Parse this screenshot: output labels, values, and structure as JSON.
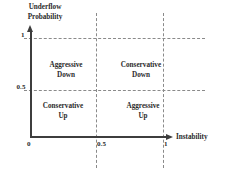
{
  "chart_data": {
    "type": "scatter",
    "title": "",
    "xlabel": "Instability",
    "ylabel": "Underflow Probability",
    "ylabel_line1": "Underflow",
    "ylabel_line2": "Probability",
    "xlim": [
      0,
      1
    ],
    "ylim": [
      0,
      1
    ],
    "x_ticks": [
      "0",
      "0.5",
      "1"
    ],
    "y_ticks": [
      "0.5",
      "1"
    ],
    "grid": true,
    "grid_style": "dashed",
    "legend": "none",
    "annotations": [
      {
        "label": "Aggressive Down",
        "line1": "Aggressive",
        "line2": "Down",
        "region": "top-left",
        "x_range": [
          0,
          0.5
        ],
        "y_range": [
          0.5,
          1
        ]
      },
      {
        "label": "Conservative Down",
        "line1": "Conservative",
        "line2": "Down",
        "region": "top-right",
        "x_range": [
          0.5,
          1
        ],
        "y_range": [
          0.5,
          1
        ]
      },
      {
        "label": "Conservative Up",
        "line1": "Conservative",
        "line2": "Up",
        "region": "bottom-left",
        "x_range": [
          0,
          0.5
        ],
        "y_range": [
          0,
          0.5
        ]
      },
      {
        "label": "Aggressive Up",
        "line1": "Aggressive",
        "line2": "Up",
        "region": "bottom-right",
        "x_range": [
          0.5,
          1
        ],
        "y_range": [
          0,
          0.5
        ]
      }
    ],
    "colors": {
      "axis": "#3d3d3d",
      "grid": "#8a8a8a",
      "text": "#2b2b2b",
      "background": "#ffffff"
    }
  },
  "axes": {
    "y": {
      "title_line1": "Underflow",
      "title_line2": "Probability",
      "tick_1": "1",
      "tick_05": "0.5"
    },
    "x": {
      "title": "Instability",
      "tick_0": "0",
      "tick_05": "0.5",
      "tick_1": "1"
    }
  },
  "quadrants": {
    "top_left": {
      "line1": "Aggressive",
      "line2": "Down"
    },
    "top_right": {
      "line1": "Conservative",
      "line2": "Down"
    },
    "bottom_left": {
      "line1": "Conservative",
      "line2": "Up"
    },
    "bottom_right": {
      "line1": "Aggressive",
      "line2": "Up"
    }
  }
}
